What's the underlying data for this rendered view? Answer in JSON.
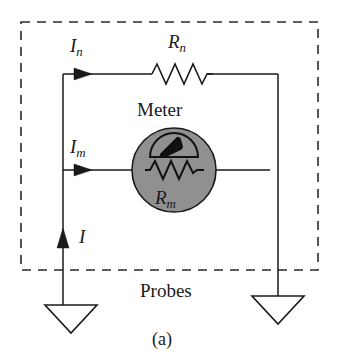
{
  "figure": {
    "caption": "(a)",
    "enclosure_label": "Probes",
    "enclosure_style": "dashed-rectangle"
  },
  "labels": {
    "current_shunt": {
      "symbol": "I",
      "subscript": "n"
    },
    "current_meter": {
      "symbol": "I",
      "subscript": "m"
    },
    "current_total": {
      "symbol": "I",
      "subscript": ""
    },
    "resistor_shunt": {
      "symbol": "R",
      "subscript": "n"
    },
    "resistor_meter": {
      "symbol": "R",
      "subscript": "m"
    },
    "meter_title": "Meter"
  },
  "components": {
    "meter": {
      "name": "Meter",
      "shape": "circle",
      "fill_color": "#909090",
      "stroke_color": "#1a1a1a",
      "internal_resistor_label": "R_m",
      "gauge": "semicircular-dial-with-pointer"
    },
    "shunt_resistor": {
      "name": "R_n",
      "shape": "zigzag",
      "peaks": 4
    },
    "probes": [
      {
        "name": "left-probe",
        "shape": "triangle-open",
        "fill_color": "#ffffff"
      },
      {
        "name": "right-probe",
        "shape": "triangle-open",
        "fill_color": "#ffffff"
      }
    ],
    "arrows": [
      {
        "name": "In-arrow",
        "direction": "right"
      },
      {
        "name": "Im-arrow",
        "direction": "right"
      },
      {
        "name": "I-arrow",
        "direction": "up"
      }
    ]
  },
  "colors": {
    "wire": "#1a1a1a",
    "meter_fill": "#909090",
    "dashed_border": "#2b2b2b",
    "background": "#ffffff",
    "text": "#1a1a1a"
  }
}
